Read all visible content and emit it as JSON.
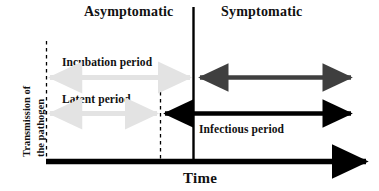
{
  "figure": {
    "title_asymptomatic": "Asymptomatic",
    "title_symptomatic": "Symptomatic",
    "y_axis_label_line1": "Transmission of",
    "y_axis_label_line2": "the pathogen",
    "x_axis_label": "Time"
  },
  "periods": {
    "incubation": {
      "label": "Incubation period",
      "color": "#e3e3e3",
      "style": "double-headed-arrow",
      "start": "infection",
      "end": "symptom-onset"
    },
    "latent": {
      "label": "Latent period",
      "color": "#e3e3e3",
      "style": "double-headed-arrow",
      "start": "infection",
      "end": "infectiousness-onset"
    },
    "symptomatic_transmission": {
      "label": "",
      "color": "#3f3f3f",
      "style": "double-headed-arrow",
      "start": "symptom-onset",
      "end": "recovery"
    },
    "infectious": {
      "label": "Infectious period",
      "color": "#000000",
      "style": "double-headed-arrow",
      "start": "infectiousness-onset",
      "end": "recovery"
    }
  },
  "markers": {
    "infection_line": "dashed",
    "infectiousness_onset_line": "dashed",
    "symptom_onset_line": "solid"
  },
  "colors": {
    "light_gray": "#e3e3e3",
    "dark_gray": "#3f3f3f",
    "black": "#000000",
    "background": "#ffffff"
  }
}
